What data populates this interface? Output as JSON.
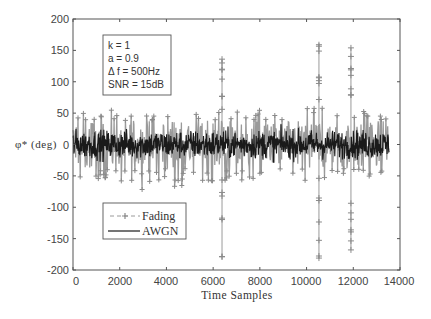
{
  "chart_data": {
    "type": "line",
    "title": "",
    "xlabel": "Time Samples",
    "ylabel": "φ* (deg)",
    "xlim": [
      0,
      14000
    ],
    "ylim": [
      -200,
      200
    ],
    "xticks": [
      0,
      2000,
      4000,
      6000,
      8000,
      10000,
      12000,
      14000
    ],
    "yticks": [
      -200,
      -150,
      -100,
      -50,
      0,
      50,
      100,
      150,
      200
    ],
    "grid": false,
    "legend_position": "lower left",
    "annotation": [
      "k = 1",
      "a = 0.9",
      "Δ f = 500Hz",
      "SNR = 15dB"
    ],
    "series": [
      {
        "name": "Fading",
        "style": "dashed line with + markers",
        "color": "#9a9a9a",
        "x_range": [
          0,
          13530
        ],
        "typical_amplitude_deg": 45,
        "spikes": [
          {
            "x": 6380,
            "max": 136,
            "min": -179
          },
          {
            "x": 10530,
            "max": 159,
            "min": -181
          },
          {
            "x": 11900,
            "max": 154,
            "min": -168
          }
        ]
      },
      {
        "name": "AWGN",
        "style": "solid line",
        "color": "#1a1a1a",
        "x_range": [
          0,
          13530
        ],
        "typical_amplitude_deg": 22
      }
    ]
  },
  "figure": {
    "xlabel": "Time Samples",
    "ylabel": "φ* (deg)",
    "annotation_lines": [
      "k = 1",
      "a = 0.9",
      "Δ f = 500Hz",
      "SNR = 15dB"
    ],
    "legend": [
      {
        "label": "Fading",
        "color": "#9a9a9a"
      },
      {
        "label": "AWGN",
        "color": "#1a1a1a"
      }
    ],
    "xtick_labels": [
      "0",
      "2000",
      "4000",
      "6000",
      "8000",
      "10000",
      "12000",
      "14000"
    ],
    "ytick_labels": [
      "200",
      "150",
      "100",
      "50",
      "0",
      "-50",
      "-100",
      "-150",
      "-200"
    ]
  }
}
